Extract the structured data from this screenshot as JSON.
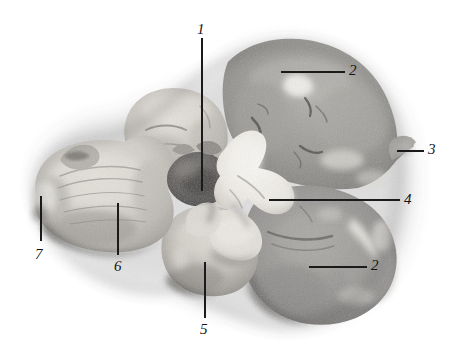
{
  "figure": {
    "kind": "anatomical-specimen-photograph",
    "background_color": "#ffffff",
    "line_color": "#1a1a1a",
    "label_color": "#141414",
    "width": 457,
    "height": 359
  },
  "labels": [
    {
      "id": "label-1",
      "text": "1",
      "x": 197,
      "y": 22,
      "leader": {
        "type": "vertical",
        "x": 202,
        "y1": 38,
        "y2": 191
      }
    },
    {
      "id": "label-2-top",
      "text": "2",
      "x": 349,
      "y": 63,
      "leader": {
        "type": "horizontal",
        "y": 72,
        "x1": 281,
        "x2": 345
      }
    },
    {
      "id": "label-3",
      "text": "3",
      "x": 428,
      "y": 142,
      "leader": {
        "type": "horizontal",
        "y": 151,
        "x1": 397,
        "x2": 424
      }
    },
    {
      "id": "label-4",
      "text": "4",
      "x": 404,
      "y": 192,
      "leader": {
        "type": "horizontal",
        "y": 200,
        "x1": 269,
        "x2": 400
      }
    },
    {
      "id": "label-2-bottom",
      "text": "2",
      "x": 371,
      "y": 258,
      "leader": {
        "type": "horizontal",
        "y": 267,
        "x1": 309,
        "x2": 367
      }
    },
    {
      "id": "label-5",
      "text": "5",
      "x": 200,
      "y": 322,
      "leader": {
        "type": "vertical",
        "x": 205,
        "y1": 262,
        "y2": 318
      }
    },
    {
      "id": "label-6",
      "text": "6",
      "x": 114,
      "y": 259,
      "leader": {
        "type": "vertical",
        "x": 118,
        "y1": 203,
        "y2": 255
      }
    },
    {
      "id": "label-7",
      "text": "7",
      "x": 35,
      "y": 247,
      "leader": {
        "type": "vertical",
        "x": 41,
        "y1": 196,
        "y2": 241
      }
    }
  ],
  "palette": {
    "tissue_mid_gray": "#9b9b9b",
    "tissue_dark_gray": "#6f6f6f",
    "tissue_light": "#cfcdc8",
    "tissue_white_matter": "#e8e6e0",
    "tissue_shadow": "#4e4e4e",
    "tissue_highlight": "#f4f2ee"
  }
}
